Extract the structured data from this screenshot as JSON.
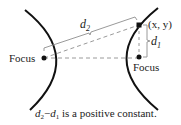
{
  "diagram": {
    "type": "hyperbola-definition",
    "labels": {
      "left_focus": "Focus",
      "right_focus": "Focus",
      "point": "(x, y)",
      "d1": "d",
      "d1_sub": "1",
      "d2": "d",
      "d2_sub": "2"
    },
    "caption": {
      "d2": "d",
      "d2_sub": "2",
      "minus": "−",
      "d1": "d",
      "d1_sub": "1",
      "rest": " is a positive constant."
    },
    "colors": {
      "curve": "#111111",
      "guide": "#9a9a9a",
      "text": "#222222"
    }
  }
}
